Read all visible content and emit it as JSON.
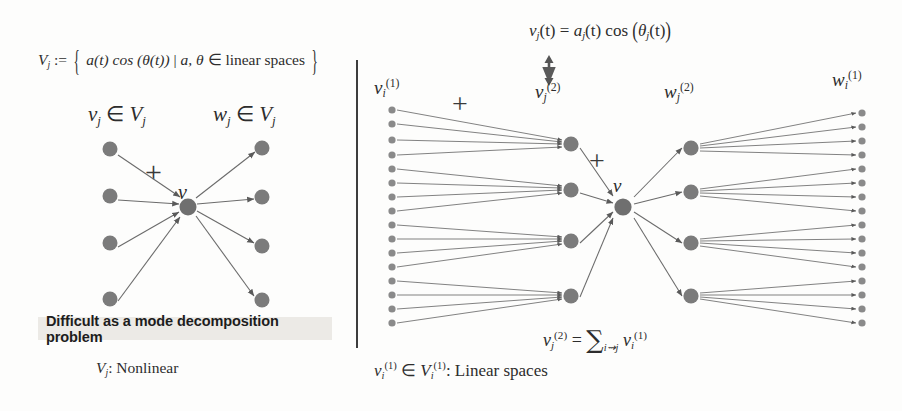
{
  "figure": {
    "title_definition": {
      "lhs": "V",
      "lhs_sub": "j",
      "relation": ":=",
      "set_open": "{",
      "body": "a(t) cos (θ(t))",
      "separator": "|",
      "condition_vars": "a, θ",
      "member_sym": "∈",
      "condition_text": "linear spaces",
      "set_close": "}",
      "full": "V_j := { a(t) cos(θ(t)) | a, θ ∈ linear spaces }"
    },
    "left_panel": {
      "label_left": {
        "base": "v",
        "sub": "j",
        "member": "∈",
        "space": "V",
        "space_sub": "j",
        "full": "v_j ∈ V_j"
      },
      "label_right": {
        "base": "w",
        "sub": "j",
        "member": "∈",
        "space": "V",
        "space_sub": "j",
        "full": "w_j ∈ V_j"
      },
      "plus_symbol": "+",
      "center_node_label": "v",
      "input_node_count": 4,
      "output_node_count": 4,
      "callout": "Difficult as a mode decomposition problem",
      "footer": {
        "base": "V",
        "sub": "j",
        "text": ": Nonlinear",
        "full": "V_j: Nonlinear"
      }
    },
    "right_panel": {
      "top_equation": {
        "lhs_base": "v",
        "lhs_sub": "j",
        "lhs_arg": "(t)",
        "eq": "=",
        "amp_base": "a",
        "amp_sub": "j",
        "amp_arg": "(t)",
        "cos": "cos",
        "phase_open": "(",
        "phase_base": "θ",
        "phase_sub": "j",
        "phase_arg": "(t)",
        "phase_close": ")",
        "full": "v_j(t) = a_j(t) cos (θ_j(t))"
      },
      "updown_arrow": "↕",
      "label_input": {
        "base": "v",
        "sub": "i",
        "sup": "(1)",
        "full": "v_i^(1)"
      },
      "label_mid_left": {
        "base": "v",
        "sub": "j",
        "sup": "(2)",
        "full": "v_j^(2)"
      },
      "label_mid_right": {
        "base": "w",
        "sub": "j",
        "sup": "(2)",
        "full": "w_j^(2)"
      },
      "label_output": {
        "base": "w",
        "sub": "i",
        "sup": "(1)",
        "full": "w_i^(1)"
      },
      "center_node_label": "v",
      "plus_symbol_left": "+",
      "plus_symbol_right": "+",
      "input_leaf_count": 16,
      "mid_node_count": 4,
      "output_leaf_count": 16,
      "sum_equation": {
        "lhs_base": "v",
        "lhs_sub": "j",
        "lhs_sup": "(2)",
        "eq": "=",
        "sum": "∑",
        "sum_index": "i⇝j",
        "term_base": "v",
        "term_sub": "i",
        "term_sup": "(1)",
        "full": "v_j^(2) = ∑_{i⇝j} v_i^(1)"
      },
      "footer": {
        "base": "v",
        "sub": "i",
        "sup": "(1)",
        "member": "∈",
        "space": "V",
        "space_sub": "i",
        "space_sup": "(1)",
        "text": ": Linear spaces",
        "full": "v_i^(1) ∈ V_i^(1): Linear spaces"
      }
    },
    "colors": {
      "node_fill": "#7a7a7a",
      "edge": "#666666",
      "text": "#2d2d2d",
      "highlight_bg": "#eceae6",
      "divider": "#3d3d3d",
      "background": "#fdfdfc"
    },
    "geometry": {
      "divider_x": 356,
      "divider_top": 60,
      "divider_bottom": 348
    }
  }
}
